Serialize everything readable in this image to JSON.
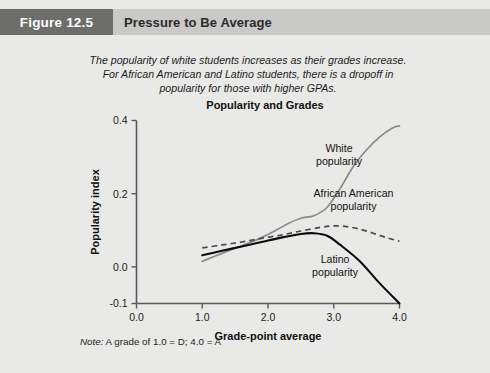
{
  "header": {
    "badge_label": "Figure 12.5",
    "title": "Pressure to Be Average",
    "badge_color": "#6d6d6b",
    "bar_color": "#c9c9c7"
  },
  "caption": {
    "line1": "The popularity of white students increases as their grades increase.",
    "line2": "For African American and Latino students, there is a dropoff in",
    "line3": "popularity for those with higher GPAs."
  },
  "note": {
    "label": "Note:",
    "text": " A grade of 1.0 = D; 4.0 = A"
  },
  "chart_data": {
    "type": "line",
    "title": "Popularity and Grades",
    "xlabel": "Grade-point average",
    "ylabel": "Popularity index",
    "xlim": [
      0.0,
      4.0
    ],
    "ylim": [
      -0.1,
      0.4
    ],
    "xticks": [
      "0.0",
      "1.0",
      "2.0",
      "3.0",
      "4.0"
    ],
    "xtick_values": [
      0.0,
      1.0,
      2.0,
      3.0,
      4.0
    ],
    "yticks": [
      "0.4",
      "0.2",
      "0.0",
      "-0.1"
    ],
    "ytick_values": [
      0.4,
      0.2,
      0.0,
      -0.1
    ],
    "grid": false,
    "legend_position": "inline-annotations",
    "series": [
      {
        "name": "White popularity",
        "style": "solid-gray",
        "color": "#8a8a8c",
        "x": [
          1.0,
          1.3,
          1.6,
          1.9,
          2.1,
          2.3,
          2.5,
          2.7,
          2.9,
          3.1,
          3.3,
          3.5,
          3.7,
          3.9,
          4.0
        ],
        "y": [
          0.015,
          0.037,
          0.058,
          0.08,
          0.098,
          0.118,
          0.133,
          0.14,
          0.163,
          0.215,
          0.275,
          0.32,
          0.355,
          0.38,
          0.385
        ]
      },
      {
        "name": "African American popularity",
        "style": "dashed",
        "color": "#4a4a4c",
        "x": [
          1.0,
          1.3,
          1.6,
          1.9,
          2.2,
          2.5,
          2.8,
          3.0,
          3.2,
          3.4,
          3.6,
          3.8,
          4.0
        ],
        "y": [
          0.052,
          0.06,
          0.068,
          0.078,
          0.087,
          0.098,
          0.108,
          0.112,
          0.11,
          0.103,
          0.092,
          0.08,
          0.07
        ]
      },
      {
        "name": "Latino popularity",
        "style": "solid-black",
        "color": "#0d0d0d",
        "x": [
          1.0,
          1.3,
          1.6,
          1.9,
          2.2,
          2.5,
          2.7,
          2.9,
          3.1,
          3.4,
          3.7,
          4.0
        ],
        "y": [
          0.032,
          0.044,
          0.056,
          0.068,
          0.08,
          0.09,
          0.092,
          0.085,
          0.06,
          0.015,
          -0.045,
          -0.1
        ]
      }
    ],
    "annotations": [
      {
        "text_line1": "White",
        "text_line2": "popularity",
        "x": 3.08,
        "y": 0.315
      },
      {
        "text_line1": "African American",
        "text_line2": "popularity",
        "x": 3.3,
        "y": 0.192
      },
      {
        "text_line1": "Latino",
        "text_line2": "popularity",
        "x": 3.02,
        "y": 0.012
      }
    ]
  }
}
